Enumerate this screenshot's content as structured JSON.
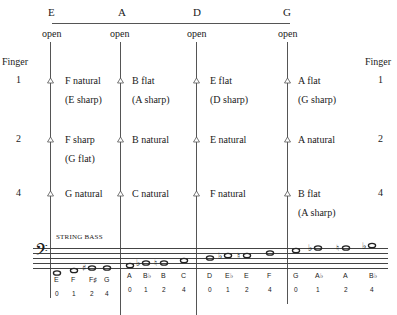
{
  "strings": [
    {
      "name": "E",
      "open": "open"
    },
    {
      "name": "A",
      "open": "open"
    },
    {
      "name": "D",
      "open": "open"
    },
    {
      "name": "G",
      "open": "open"
    }
  ],
  "finger_header_left": "Finger",
  "finger_header_right": "Finger",
  "rows": [
    {
      "finger": "1",
      "notes": [
        {
          "main": "F natural",
          "alt": "(E sharp)"
        },
        {
          "main": "B flat",
          "alt": "(A sharp)"
        },
        {
          "main": "E flat",
          "alt": "(D sharp)"
        },
        {
          "main": "A flat",
          "alt": "(G sharp)"
        }
      ]
    },
    {
      "finger": "2",
      "notes": [
        {
          "main": "F sharp",
          "alt": "(G flat)"
        },
        {
          "main": "B natural",
          "alt": ""
        },
        {
          "main": "E natural",
          "alt": ""
        },
        {
          "main": "A natural",
          "alt": ""
        }
      ]
    },
    {
      "finger": "4",
      "notes": [
        {
          "main": "G natural",
          "alt": ""
        },
        {
          "main": "C natural",
          "alt": ""
        },
        {
          "main": "F natural",
          "alt": ""
        },
        {
          "main": "B flat",
          "alt": "(A sharp)"
        }
      ]
    }
  ],
  "staff": {
    "title": "STRING BASS",
    "clef": "bass-clef",
    "groups": [
      {
        "notes": [
          "E",
          "F",
          "F♯",
          "G"
        ],
        "fingers": [
          "0",
          "1",
          "2",
          "4"
        ]
      },
      {
        "notes": [
          "A",
          "B♭",
          "B",
          "C"
        ],
        "fingers": [
          "0",
          "1",
          "2",
          "4"
        ]
      },
      {
        "notes": [
          "D",
          "E♭",
          "E",
          "F"
        ],
        "fingers": [
          "0",
          "1",
          "2",
          "4"
        ]
      },
      {
        "notes": [
          "G",
          "A♭",
          "A",
          "B♭"
        ],
        "fingers": [
          "0",
          "1",
          "2",
          "4"
        ]
      }
    ]
  }
}
